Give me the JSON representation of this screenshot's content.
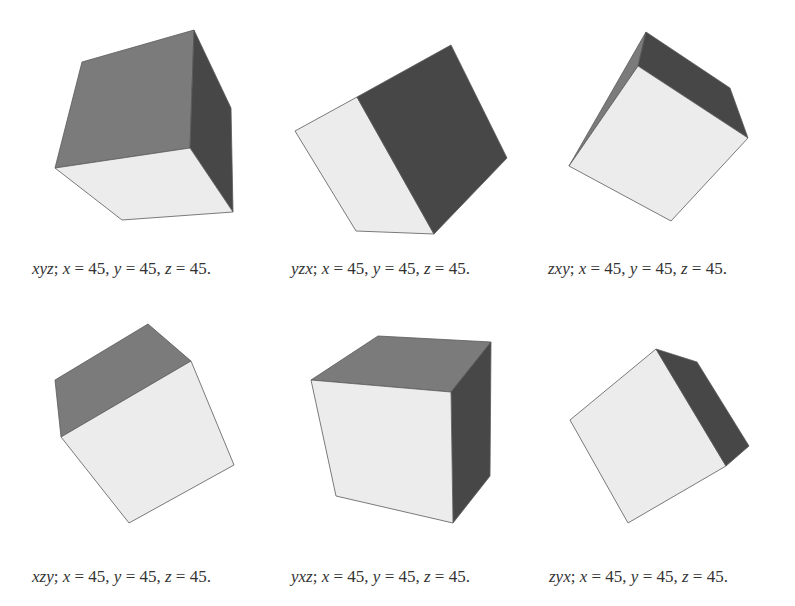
{
  "colors": {
    "background": "#ffffff",
    "light_face": "#ececec",
    "mid_face": "#7b7b7b",
    "dark_face": "#474747",
    "edge": "#5a5a5a",
    "text": "#333333"
  },
  "panels": [
    {
      "order": "xyz",
      "caption": {
        "order": "xyz",
        "sep": ";",
        "x_label": "x",
        "x_value": "45",
        "y_label": "y",
        "y_value": "45",
        "z_label": "z",
        "z_value": "45"
      },
      "faces": [
        {
          "shade": "mid",
          "points": "82,62 194,30 190,148 55,168"
        },
        {
          "shade": "dark",
          "points": "194,30 231,108 233,212 190,148"
        },
        {
          "shade": "light",
          "points": "55,168 190,148 233,212 122,220"
        }
      ]
    },
    {
      "order": "yzx",
      "caption": {
        "order": "yzx",
        "sep": ";",
        "x_label": "x",
        "x_value": "45",
        "y_label": "y",
        "y_value": "45",
        "z_label": "z",
        "z_value": "45"
      },
      "faces": [
        {
          "shade": "light",
          "points": "295,131 357,97 434,234 356,231"
        },
        {
          "shade": "dark",
          "points": "357,97 451,45 507,158 434,234"
        }
      ]
    },
    {
      "order": "zxy",
      "caption": {
        "order": "zxy",
        "sep": ";",
        "x_label": "x",
        "x_value": "45",
        "y_label": "y",
        "y_value": "45",
        "z_label": "z",
        "z_value": "45"
      },
      "faces": [
        {
          "shade": "mid",
          "points": "569,166 646,32 638,66"
        },
        {
          "shade": "dark",
          "points": "638,66 646,32 730,88 748,138"
        },
        {
          "shade": "light",
          "points": "638,66 748,138 671,221 569,166"
        }
      ]
    },
    {
      "order": "xzy",
      "caption": {
        "order": "xzy",
        "sep": ";",
        "x_label": "x",
        "x_value": "45",
        "y_label": "y",
        "y_value": "45",
        "z_label": "z",
        "z_value": "45"
      },
      "faces": [
        {
          "shade": "mid",
          "points": "55,380 148,324 191,361 61,437"
        },
        {
          "shade": "light",
          "points": "61,437 191,361 234,465 129,523"
        }
      ]
    },
    {
      "order": "yxz",
      "caption": {
        "order": "yxz",
        "sep": ";",
        "x_label": "x",
        "x_value": "45",
        "y_label": "y",
        "y_value": "45",
        "z_label": "z",
        "z_value": "45"
      },
      "faces": [
        {
          "shade": "mid",
          "points": "311,380 378,336 491,342 451,392"
        },
        {
          "shade": "dark",
          "points": "451,392 491,342 490,476 453,523"
        },
        {
          "shade": "light",
          "points": "311,380 451,392 453,523 336,496"
        }
      ]
    },
    {
      "order": "zyx",
      "caption": {
        "order": "zyx",
        "sep": ";",
        "x_label": "x",
        "x_value": "45",
        "y_label": "y",
        "y_value": "45",
        "z_label": "z",
        "z_value": "45"
      },
      "faces": [
        {
          "shade": "light",
          "points": "570,420 656,349 726,466 628,523"
        },
        {
          "shade": "dark",
          "points": "656,349 697,362 749,446 726,466"
        }
      ]
    }
  ]
}
